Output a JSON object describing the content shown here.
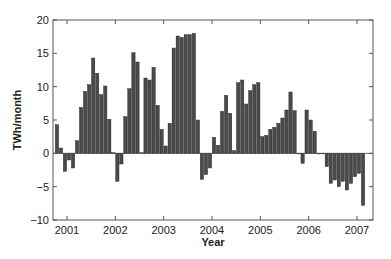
{
  "chart_data": {
    "type": "bar",
    "title": "",
    "xlabel": "Year",
    "ylabel": "TWh/month",
    "ylim": [
      -10,
      20
    ],
    "yticks": [
      -10,
      -5,
      0,
      5,
      10,
      15,
      20
    ],
    "xticks": [
      "2001",
      "2002",
      "2003",
      "2004",
      "2005",
      "2006",
      "2007"
    ],
    "grid": false,
    "legend": null,
    "bar_color": "#4a4a4a",
    "start_month": "2000-10",
    "frequency": "monthly",
    "values": [
      4.3,
      0.8,
      -2.7,
      -1.0,
      -2.2,
      1.9,
      6.9,
      9.3,
      10.3,
      14.3,
      12.0,
      8.8,
      10.1,
      5.1,
      0.1,
      -4.2,
      -1.6,
      5.5,
      9.7,
      15.1,
      13.7,
      0.1,
      11.3,
      11.0,
      12.9,
      7.2,
      3.6,
      1.1,
      4.5,
      15.8,
      17.6,
      17.4,
      17.8,
      17.8,
      18.0,
      5.0,
      -3.9,
      -3.2,
      -2.2,
      2.4,
      1.2,
      6.3,
      8.7,
      6.0,
      0.4,
      10.6,
      11.0,
      7.4,
      9.4,
      10.3,
      10.6,
      2.5,
      2.7,
      3.6,
      3.9,
      4.5,
      5.3,
      6.5,
      9.2,
      6.4,
      0.0,
      -1.5,
      6.5,
      5.0,
      3.3,
      0.0,
      0.0,
      -2.0,
      -4.5,
      -4.0,
      -5.0,
      -4.2,
      -5.5,
      -4.5,
      -3.5,
      -3.0,
      -7.8
    ]
  },
  "axes": {
    "xlabel": "Year",
    "ylabel": "TWh/month"
  }
}
